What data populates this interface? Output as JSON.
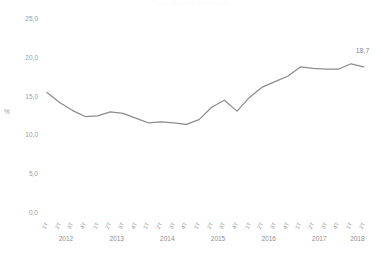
{
  "chart_data": {
    "type": "line",
    "title": "Tasa de paro trimestral",
    "xlabel": "",
    "ylabel": "%",
    "ylim": [
      0.0,
      25.0
    ],
    "yticks": [
      "0,0",
      "5,0",
      "10,0",
      "15,0",
      "20,0",
      "25,0"
    ],
    "ytick_values": [
      0.0,
      5.0,
      10.0,
      15.0,
      20.0,
      25.0
    ],
    "grid": false,
    "legend": "none",
    "decimal_separator": ",",
    "line_color": "#8c8c8c",
    "categories": [
      "1T",
      "2T",
      "3T",
      "4T",
      "1T",
      "2T",
      "3T",
      "4T",
      "1T",
      "2T",
      "3T",
      "4T",
      "1T",
      "2T",
      "3T",
      "4T",
      "1T",
      "2T",
      "3T",
      "4T",
      "1T",
      "2T",
      "3T",
      "4T",
      "1T",
      "2T"
    ],
    "year_groups": [
      {
        "year": "2012",
        "quarters": 4
      },
      {
        "year": "2013",
        "quarters": 4
      },
      {
        "year": "2014",
        "quarters": 4
      },
      {
        "year": "2015",
        "quarters": 4
      },
      {
        "year": "2016",
        "quarters": 4
      },
      {
        "year": "2017",
        "quarters": 4
      },
      {
        "year": "2018",
        "quarters": 2
      }
    ],
    "values": [
      15.4,
      14.1,
      13.1,
      12.3,
      12.4,
      12.9,
      12.7,
      12.1,
      11.5,
      11.6,
      11.5,
      11.3,
      11.9,
      13.5,
      14.4,
      13.0,
      14.8,
      16.1,
      16.8,
      17.5,
      18.7,
      18.5,
      18.4,
      18.4,
      19.1,
      18.7
    ],
    "last_point_label": "18,7",
    "last_point_value": 18.7
  }
}
